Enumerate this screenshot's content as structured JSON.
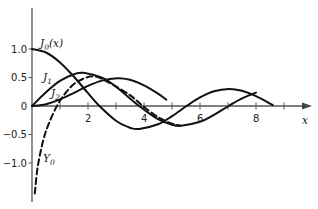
{
  "chart_data": {
    "type": "line",
    "title": "",
    "xlabel": "x",
    "ylabel": "",
    "xlim": [
      0,
      9.6
    ],
    "ylim": [
      -1.65,
      1.7
    ],
    "grid": false,
    "x_ticks": [
      1,
      2,
      3,
      4,
      5,
      6,
      7,
      8,
      9
    ],
    "x_tick_labels": [
      {
        "value": 2,
        "label": "2"
      },
      {
        "value": 4,
        "label": "4"
      },
      {
        "value": 6,
        "label": "6"
      },
      {
        "value": 8,
        "label": "8"
      }
    ],
    "y_tick_labels": [
      {
        "value": 1.0,
        "label": "1.0"
      },
      {
        "value": 0.5,
        "label": "0.5"
      },
      {
        "value": 0,
        "label": "0"
      },
      {
        "value": -0.5,
        "label": "−0.5"
      },
      {
        "value": -1.0,
        "label": "−1.0"
      }
    ],
    "series": [
      {
        "name": "J0(x)",
        "label": "J",
        "subscript": "0",
        "suffix": "(x)",
        "style": "solid",
        "x_range": [
          0,
          8.6
        ],
        "x": [
          0,
          0.5,
          1,
          1.5,
          2,
          2.4,
          3,
          3.5,
          3.83,
          4.5,
          5,
          5.52,
          6,
          6.5,
          7.02,
          7.5,
          8,
          8.6
        ],
        "values": [
          1.0,
          0.938,
          0.765,
          0.512,
          0.224,
          0.003,
          -0.26,
          -0.38,
          -0.403,
          -0.321,
          -0.178,
          0.0,
          0.151,
          0.26,
          0.3,
          0.266,
          0.172,
          0.015
        ]
      },
      {
        "name": "J1",
        "label": "J",
        "subscript": "1",
        "suffix": "",
        "style": "solid",
        "x_range": [
          0,
          8.0
        ],
        "x": [
          0,
          0.5,
          1,
          1.5,
          1.84,
          2.5,
          3,
          3.83,
          4.5,
          5,
          5.33,
          6,
          6.5,
          7.02,
          7.5,
          8
        ],
        "values": [
          0.0,
          0.242,
          0.44,
          0.558,
          0.582,
          0.497,
          0.339,
          0.0,
          -0.231,
          -0.328,
          -0.346,
          -0.277,
          -0.154,
          0.0,
          0.135,
          0.235
        ]
      },
      {
        "name": "J2",
        "label": "J",
        "subscript": "2",
        "suffix": "",
        "style": "solid",
        "x_range": [
          0,
          4.8
        ],
        "x": [
          0,
          0.5,
          1,
          1.5,
          2,
          2.5,
          3.05,
          3.5,
          4,
          4.5,
          4.8
        ],
        "values": [
          0.0,
          0.031,
          0.115,
          0.232,
          0.353,
          0.446,
          0.486,
          0.459,
          0.364,
          0.218,
          0.11
        ]
      },
      {
        "name": "Y0",
        "label": "Y",
        "subscript": "0",
        "suffix": "",
        "style": "dashed",
        "x_range": [
          0.1,
          5.3
        ],
        "x": [
          0.1,
          0.2,
          0.4,
          0.6,
          0.89,
          1.2,
          1.6,
          2.2,
          2.8,
          3.5,
          3.96,
          4.5,
          5.0,
          5.3
        ],
        "values": [
          -1.534,
          -1.081,
          -0.606,
          -0.309,
          0.0,
          0.228,
          0.42,
          0.521,
          0.397,
          0.189,
          0.0,
          -0.195,
          -0.309,
          -0.345
        ]
      }
    ]
  },
  "labels": {
    "j0": {
      "main": "J",
      "sub": "0",
      "suffix": "(x)"
    },
    "j1": {
      "main": "J",
      "sub": "1"
    },
    "j2": {
      "main": "J",
      "sub": "2"
    },
    "y0": {
      "main": "Y",
      "sub": "0"
    },
    "x_axis": "x"
  }
}
